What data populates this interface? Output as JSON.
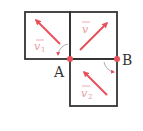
{
  "diagram": {
    "colors": {
      "grid": "#333333",
      "vector": "#e8505b",
      "label": "#333333"
    },
    "points": [
      {
        "name": "A",
        "label": "A"
      },
      {
        "name": "B",
        "label": "B"
      }
    ],
    "vectors": [
      {
        "name": "v1",
        "label": "v",
        "sub": "1",
        "direction": "up-left"
      },
      {
        "name": "v",
        "label": "v",
        "sub": "",
        "direction": "up-right"
      },
      {
        "name": "v2",
        "label": "v",
        "sub": "2",
        "direction": "up-left"
      }
    ],
    "rotation_arcs": [
      {
        "near": "A",
        "direction": "counter-clockwise"
      },
      {
        "near": "B",
        "direction": "clockwise"
      }
    ]
  }
}
